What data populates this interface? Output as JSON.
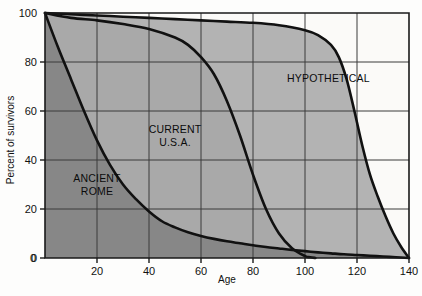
{
  "chart_data": {
    "type": "line",
    "title": "",
    "subtitle": "",
    "xlabel": "Age",
    "ylabel": "Percent of survivors",
    "xlim": [
      0,
      140
    ],
    "ylim": [
      0,
      100
    ],
    "xticks": [
      0,
      20,
      40,
      60,
      80,
      100,
      120,
      140
    ],
    "xtick_labels": [
      "0",
      "20",
      "40",
      "60",
      "80",
      "100",
      "120",
      "140"
    ],
    "yticks": [
      0,
      20,
      40,
      60,
      80,
      100
    ],
    "ytick_labels": [
      "0",
      "20",
      "40",
      "60",
      "80",
      "100"
    ],
    "grid": true,
    "legend_position": "inline-annotations",
    "annotations": [
      {
        "text": "ANCIENT ROME",
        "lines": [
          "ANCIENT",
          "ROME"
        ],
        "x": 20,
        "y": 31
      },
      {
        "text": "CURRENT U.S.A.",
        "lines": [
          "CURRENT",
          "U.S.A."
        ],
        "x": 50,
        "y": 51
      },
      {
        "text": "HYPOTHETICAL",
        "lines": [
          "HYPOTHETICAL"
        ],
        "x": 109,
        "y": 72
      }
    ],
    "series": [
      {
        "name": "ANCIENT ROME",
        "fill_color": "#878787",
        "line_color": "#111111",
        "x": [
          0,
          5,
          10,
          15,
          20,
          25,
          30,
          35,
          40,
          45,
          50,
          55,
          60,
          65,
          70,
          75,
          80,
          85,
          90,
          95,
          100,
          105,
          110,
          115,
          120,
          125,
          130,
          135,
          140
        ],
        "values": [
          100,
          86,
          73,
          60,
          48,
          38,
          30,
          24,
          19,
          15,
          12.5,
          10.5,
          9,
          7.8,
          6.8,
          6,
          5.2,
          4.5,
          3.9,
          3.3,
          2.8,
          2.3,
          1.9,
          1.5,
          1.2,
          0.9,
          0.6,
          0.3,
          0
        ]
      },
      {
        "name": "CURRENT U.S.A.",
        "fill_color": "#a9a9a9",
        "line_color": "#111111",
        "x": [
          0,
          10,
          20,
          30,
          40,
          50,
          55,
          60,
          65,
          70,
          75,
          80,
          85,
          90,
          95,
          100,
          102,
          104
        ],
        "values": [
          100,
          98,
          97,
          95.5,
          93.5,
          90,
          87,
          82,
          75,
          64,
          50,
          34,
          20,
          10,
          4,
          0.8,
          0.3,
          0
        ]
      },
      {
        "name": "HYPOTHETICAL",
        "fill_color": "#b3b3b3",
        "line_color": "#111111",
        "x": [
          0,
          10,
          20,
          30,
          40,
          50,
          60,
          70,
          80,
          90,
          100,
          105,
          110,
          113,
          116,
          119,
          122,
          125,
          128,
          131,
          134,
          137,
          140
        ],
        "values": [
          100,
          99.5,
          99,
          98.5,
          98,
          97.5,
          97,
          96.5,
          96,
          95,
          93,
          91,
          87,
          82,
          73,
          60,
          46,
          34,
          25,
          17,
          10,
          4.5,
          0
        ]
      }
    ]
  },
  "plot": {
    "background_color": "#fbfbfa",
    "axis_color": "#1a1a1a",
    "grid_color": "#3a3a3a",
    "line_color": "#111111",
    "region_colors": {
      "ancient_rome": "#878787",
      "current_usa": "#a9a9a9",
      "hypothetical": "#b3b3b3"
    }
  }
}
